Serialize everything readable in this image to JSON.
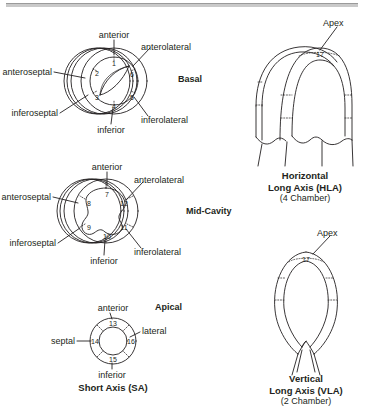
{
  "figure": {
    "stroke_color": "#231f20",
    "background_color": "#ffffff"
  },
  "short_axis": {
    "group_caption": "Short Axis (SA)",
    "levels": [
      {
        "name": "basal",
        "level_label": "Basal",
        "segments": [
          {
            "number": "1",
            "region": "anterior"
          },
          {
            "number": "2",
            "region": "anteroseptal"
          },
          {
            "number": "3",
            "region": "inferoseptal"
          },
          {
            "number": "4",
            "region": "inferior"
          },
          {
            "number": "5",
            "region": "inferolateral"
          },
          {
            "number": "6",
            "region": "anterolateral"
          }
        ],
        "callouts": [
          {
            "text": "anterior"
          },
          {
            "text": "anterolateral"
          },
          {
            "text": "anteroseptal"
          },
          {
            "text": "inferoseptal"
          },
          {
            "text": "inferior"
          },
          {
            "text": "inferolateral"
          }
        ]
      },
      {
        "name": "mid-cavity",
        "level_label": "Mid-Cavity",
        "segments": [
          {
            "number": "7",
            "region": "anterior"
          },
          {
            "number": "8",
            "region": "anteroseptal"
          },
          {
            "number": "9",
            "region": "inferoseptal"
          },
          {
            "number": "10",
            "region": "inferior"
          },
          {
            "number": "11",
            "region": "inferolateral"
          },
          {
            "number": "12",
            "region": "anterolateral"
          }
        ],
        "callouts": [
          {
            "text": "anterior"
          },
          {
            "text": "anterolateral"
          },
          {
            "text": "anteroseptal"
          },
          {
            "text": "inferoseptal"
          },
          {
            "text": "inferior"
          },
          {
            "text": "inferolateral"
          }
        ]
      },
      {
        "name": "apical",
        "level_label": "Apical",
        "segments": [
          {
            "number": "13",
            "region": "anterior"
          },
          {
            "number": "14",
            "region": "septal"
          },
          {
            "number": "15",
            "region": "inferior"
          },
          {
            "number": "16",
            "region": "lateral"
          }
        ],
        "callouts": [
          {
            "text": "anterior"
          },
          {
            "text": "lateral"
          },
          {
            "text": "septal"
          },
          {
            "text": "inferior"
          }
        ]
      }
    ]
  },
  "long_axis": {
    "views": [
      {
        "name": "hla",
        "apex_label": "Apex",
        "apex_segment": "17",
        "caption_line1": "Horizontal",
        "caption_line2": "Long Axis (HLA)",
        "caption_line3": "(4 Chamber)"
      },
      {
        "name": "vla",
        "apex_label": "Apex",
        "apex_segment": "17",
        "caption_line1": "Vertical",
        "caption_line2": "Long Axis (VLA)",
        "caption_line3": "(2 Chamber)"
      }
    ]
  }
}
